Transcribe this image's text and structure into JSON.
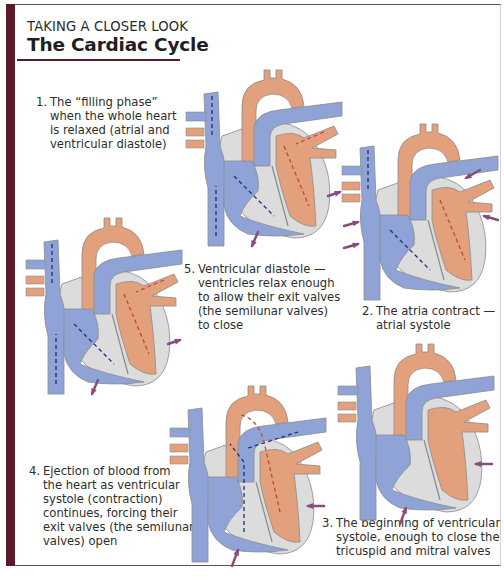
{
  "header": {
    "kicker": "TAKING A CLOSER LOOK",
    "title": "The Cardiac Cycle"
  },
  "colors": {
    "accent_bar": "#5a1a28",
    "deoxygenated_blood": "#8fa3d6",
    "oxygenated_blood": "#e3a07c",
    "heart_wall": "#dcdcdc",
    "contraction_arrow": "#8a4a7e",
    "flow_arrow_blue": "#1e2f7a",
    "flow_arrow_red": "#c0492c"
  },
  "stages": [
    {
      "number": "1.",
      "lines": [
        "The “filling phase”",
        "when the whole heart",
        "is relaxed (atrial and",
        "ventricular diastole)"
      ],
      "icon": "heart-diagram-filling-phase"
    },
    {
      "number": "2.",
      "lines": [
        "The atria contract —",
        "atrial systole"
      ],
      "icon": "heart-diagram-atrial-systole"
    },
    {
      "number": "3.",
      "lines": [
        "The beginning of ventricular",
        "systole, enough to close the",
        "tricuspid and mitral valves"
      ],
      "icon": "heart-diagram-early-ventricular-systole"
    },
    {
      "number": "4.",
      "lines": [
        "Ejection of blood from",
        "the heart as ventricular",
        "systole (contraction)",
        "continues, forcing their",
        "exit valves (the semilunar",
        "valves) open"
      ],
      "icon": "heart-diagram-ejection"
    },
    {
      "number": "5.",
      "lines": [
        "Ventricular diastole —",
        "ventricles relax enough",
        "to allow their exit valves",
        "(the semilunar valves)",
        "to close"
      ],
      "icon": "heart-diagram-ventricular-diastole"
    }
  ]
}
